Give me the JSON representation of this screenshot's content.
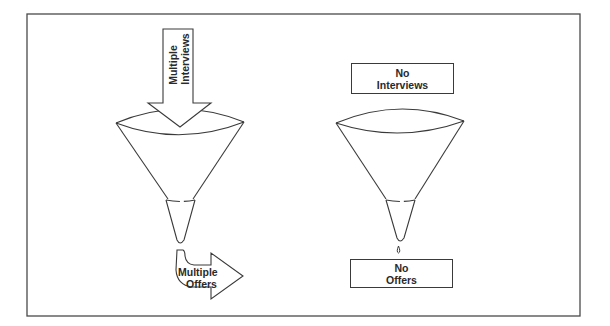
{
  "diagram": {
    "left_panel": {
      "input_arrow": {
        "line1": "Multiple",
        "line2": "Interviews"
      },
      "output_arrow": {
        "line1": "Multiple",
        "line2": "Offers"
      }
    },
    "right_panel": {
      "input_box": {
        "line1": "No",
        "line2": "Interviews"
      },
      "output_box": {
        "line1": "No",
        "line2": "Offers"
      }
    }
  },
  "colors": {
    "stroke": "#3a3a3a",
    "background": "#ffffff",
    "text": "#2a2a2a"
  }
}
